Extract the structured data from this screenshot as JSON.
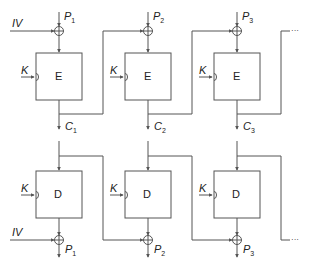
{
  "encryption": {
    "iv_label": "IV",
    "stages": [
      {
        "block": "E",
        "key": "K",
        "input": "P",
        "input_sub": "1",
        "output": "C",
        "output_sub": "1"
      },
      {
        "block": "E",
        "key": "K",
        "input": "P",
        "input_sub": "2",
        "output": "C",
        "output_sub": "2"
      },
      {
        "block": "E",
        "key": "K",
        "input": "P",
        "input_sub": "3",
        "output": "C",
        "output_sub": "3"
      }
    ],
    "continuation": "···"
  },
  "decryption": {
    "iv_label": "IV",
    "stages": [
      {
        "block": "D",
        "key": "K",
        "output": "P",
        "output_sub": "1"
      },
      {
        "block": "D",
        "key": "K",
        "output": "P",
        "output_sub": "2"
      },
      {
        "block": "D",
        "key": "K",
        "output": "P",
        "output_sub": "3"
      }
    ],
    "continuation": "···"
  },
  "colors": {
    "line": "#555555",
    "text": "#222222",
    "background": "#ffffff"
  }
}
